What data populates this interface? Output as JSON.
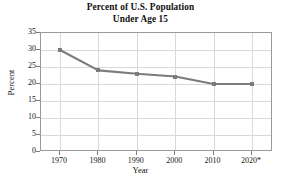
{
  "chart_data": {
    "type": "line",
    "title": "Percent of U.S. Population Under Age 15",
    "title_lines": [
      "Percent of U.S. Population",
      "Under Age 15"
    ],
    "xlabel": "Year",
    "ylabel": "Percent",
    "categories": [
      "1970",
      "1980",
      "1990",
      "2000",
      "2010",
      "2020*"
    ],
    "x": [
      1970,
      1980,
      1990,
      2000,
      2010,
      2020
    ],
    "values": [
      30,
      24,
      23,
      22.2,
      20,
      20
    ],
    "series": [
      {
        "name": "Percent under age 15",
        "values": [
          30,
          24,
          23,
          22.2,
          20,
          20
        ]
      }
    ],
    "ylim": [
      0,
      35
    ],
    "ytick_values": [
      35,
      30,
      25,
      20,
      15,
      10,
      5,
      0
    ],
    "ytick_labels": [
      "35",
      "30",
      "25",
      "20",
      "15",
      "10",
      "5",
      "0"
    ],
    "xtick_labels": [
      "1970",
      "1980",
      "1990",
      "2000",
      "2010",
      "2020*"
    ],
    "grid": true,
    "legend": null,
    "legend_position": "none",
    "marker": "square",
    "line_color": "#7b7b7b",
    "marker_color": "#7b7b7b",
    "grid_color": "#d9d9d9",
    "frame_color": "#9a9a9a",
    "text_color": "#111111",
    "background": "#ffffff",
    "note": "2020 value marked with asterisk (projected)"
  }
}
